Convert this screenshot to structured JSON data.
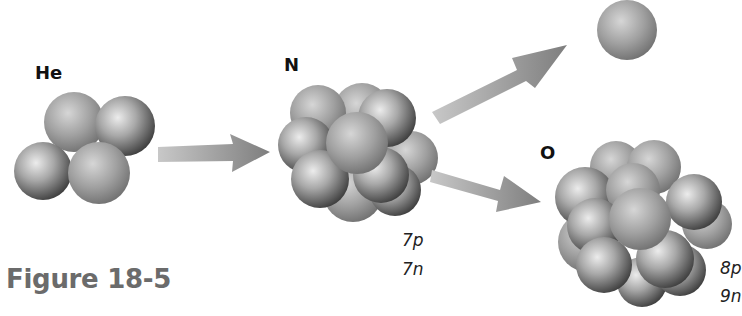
{
  "figure": {
    "caption": "Figure 18-5",
    "nuclei": {
      "helium": {
        "label": "He"
      },
      "nitrogen": {
        "label": "N",
        "protons": "7p",
        "neutrons": "7n"
      },
      "oxygen": {
        "label": "O",
        "protons": "8p",
        "neutrons": "9n"
      },
      "proton": {
        "label": ""
      }
    },
    "arrows": [
      "helium-to-nitrogen",
      "nitrogen-to-proton",
      "nitrogen-to-oxygen"
    ],
    "colors": {
      "sphere_light": "#e8e8e8",
      "sphere_mid": "#9a9a9a",
      "sphere_dark": "#4a4a4a",
      "arrow": "#8a8a8a",
      "caption": "#6b6b6b"
    }
  }
}
